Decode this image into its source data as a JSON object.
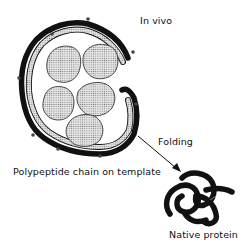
{
  "diagram": {
    "labels": {
      "in_vivo": "In vivo",
      "folding": "Folding",
      "template": "Polypeptide chain on template",
      "native": "Native protein"
    },
    "elements": {
      "template_blobs": 5,
      "arrow_direction": "template-to-native-protein"
    },
    "colors": {
      "ink": "#111111",
      "stipple": "#bdbdbd",
      "background": "#ffffff"
    }
  }
}
